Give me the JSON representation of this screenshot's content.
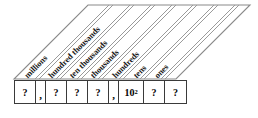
{
  "diagram": {
    "type": "place-value-chart",
    "colors": {
      "line": "#3a3a3a",
      "band_line": "#8a8a8a",
      "text": "#1a1a1a",
      "background": "#ffffff"
    },
    "labels": [
      {
        "id": "millions",
        "text": "millions",
        "x": 22,
        "y": 73
      },
      {
        "id": "hundred-thousands",
        "text": "hundred thousands",
        "x": 46,
        "y": 73
      },
      {
        "id": "ten-thousands",
        "text": "ten thousands",
        "x": 67,
        "y": 73
      },
      {
        "id": "thousands",
        "text": "thousands",
        "x": 88,
        "y": 73
      },
      {
        "id": "hundreds",
        "text": "hundreds",
        "x": 110,
        "y": 73
      },
      {
        "id": "tens",
        "text": "tens",
        "x": 131,
        "y": 73
      },
      {
        "id": "ones",
        "text": "ones",
        "x": 152,
        "y": 73
      }
    ],
    "cells": [
      {
        "id": "cell-millions",
        "kind": "digit",
        "value": "?"
      },
      {
        "id": "separator-1",
        "kind": "sep",
        "value": ","
      },
      {
        "id": "cell-hundred-thousands",
        "kind": "digit",
        "value": "?"
      },
      {
        "id": "cell-ten-thousands",
        "kind": "digit",
        "value": "?"
      },
      {
        "id": "cell-thousands",
        "kind": "digit",
        "value": "?"
      },
      {
        "id": "separator-2",
        "kind": "sep",
        "value": ","
      },
      {
        "id": "cell-hundreds",
        "kind": "pow",
        "base": "10",
        "exponent": "2"
      },
      {
        "id": "cell-tens",
        "kind": "digit",
        "value": "?"
      },
      {
        "id": "cell-ones",
        "kind": "digit",
        "value": "?"
      }
    ]
  }
}
